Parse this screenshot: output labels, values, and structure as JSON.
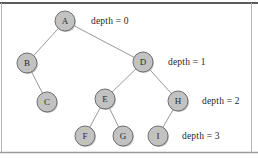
{
  "figure": {
    "background_color": "#ffffff",
    "frame_color": "#7b7b7b",
    "node_fill_color": "#c2c2c2",
    "node_stroke_color": "#6e6e6e",
    "edge_color": "#8d8d8d",
    "text_color": "#1f1f1f"
  },
  "nodes": [
    {
      "id": "A",
      "label": "A",
      "cx": 65,
      "cy": 21,
      "r": 10,
      "depth": 0
    },
    {
      "id": "B",
      "label": "B",
      "cx": 27,
      "cy": 63,
      "r": 10,
      "depth": 1
    },
    {
      "id": "D",
      "label": "D",
      "cx": 143,
      "cy": 62,
      "r": 10,
      "depth": 1
    },
    {
      "id": "C",
      "label": "C",
      "cx": 47,
      "cy": 102,
      "r": 10,
      "depth": 2
    },
    {
      "id": "E",
      "label": "E",
      "cx": 105,
      "cy": 99,
      "r": 10,
      "depth": 2
    },
    {
      "id": "H",
      "label": "H",
      "cx": 178,
      "cy": 101,
      "r": 10,
      "depth": 2
    },
    {
      "id": "F",
      "label": "F",
      "cx": 85,
      "cy": 136,
      "r": 10,
      "depth": 3
    },
    {
      "id": "G",
      "label": "G",
      "cx": 123,
      "cy": 136,
      "r": 10,
      "depth": 3
    },
    {
      "id": "I",
      "label": "I",
      "cx": 158,
      "cy": 136,
      "r": 10,
      "depth": 3
    }
  ],
  "edges": [
    {
      "from": "A",
      "to": "B"
    },
    {
      "from": "A",
      "to": "D"
    },
    {
      "from": "B",
      "to": "C"
    },
    {
      "from": "D",
      "to": "E"
    },
    {
      "from": "D",
      "to": "H"
    },
    {
      "from": "E",
      "to": "F"
    },
    {
      "from": "E",
      "to": "G"
    },
    {
      "from": "H",
      "to": "I"
    }
  ],
  "depth_labels": [
    {
      "text": "depth = 0",
      "x": 91,
      "y": 21
    },
    {
      "text": "depth = 1",
      "x": 168,
      "y": 62
    },
    {
      "text": "depth = 2",
      "x": 202,
      "y": 101
    },
    {
      "text": "depth = 3",
      "x": 182,
      "y": 136
    }
  ]
}
